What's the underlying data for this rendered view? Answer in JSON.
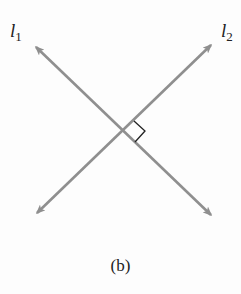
{
  "diagram": {
    "lines": [
      {
        "name": "l1",
        "label_main": "l",
        "label_sub": "1",
        "from": [
          33,
          44
        ],
        "to": [
          214,
          218
        ]
      },
      {
        "name": "l2",
        "label_main": "l",
        "label_sub": "2",
        "from": [
          214,
          42
        ],
        "to": [
          34,
          216
        ]
      }
    ],
    "right_angle_marker": true,
    "line_color": "#8f8f8f",
    "caption": "(b)"
  }
}
